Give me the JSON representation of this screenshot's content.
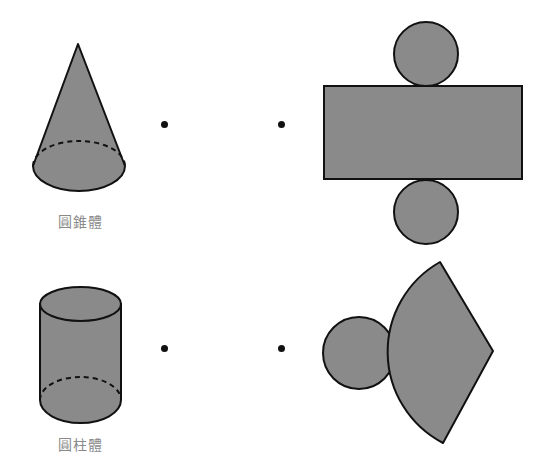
{
  "colors": {
    "fill": "#8a8a8a",
    "stroke": "#111111",
    "label": "#8a8a8a",
    "background": "#ffffff"
  },
  "rows": [
    {
      "solid": {
        "name": "cone",
        "label": "圓錐體"
      },
      "connector": {
        "left_dot": "•",
        "right_dot": "•"
      },
      "net": {
        "name": "cylinder-net",
        "parts": [
          "circle-top",
          "rectangle",
          "circle-bottom"
        ]
      }
    },
    {
      "solid": {
        "name": "cylinder",
        "label": "圓柱體"
      },
      "connector": {
        "left_dot": "•",
        "right_dot": "•"
      },
      "net": {
        "name": "cone-net",
        "parts": [
          "circle",
          "sector"
        ]
      }
    }
  ]
}
